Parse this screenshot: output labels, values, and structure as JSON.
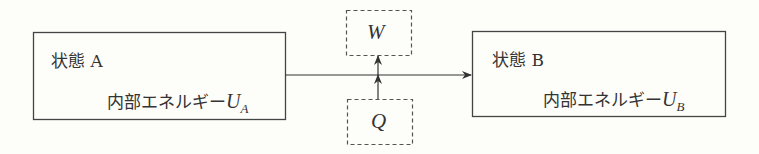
{
  "diagram": {
    "state_a": {
      "title": "状態 A",
      "energy_label": "内部エネルギー",
      "energy_symbol": "U",
      "energy_subscript": "A"
    },
    "state_b": {
      "title": "状態 B",
      "energy_label": "内部エネルギー",
      "energy_symbol": "U",
      "energy_subscript": "B"
    },
    "work": {
      "symbol": "W"
    },
    "heat": {
      "symbol": "Q"
    },
    "edges": [
      {
        "from": "state_a",
        "to": "state_b",
        "style": "solid-arrow"
      },
      {
        "from": "heat",
        "to": "work",
        "style": "solid-arrow-vertical"
      }
    ]
  }
}
